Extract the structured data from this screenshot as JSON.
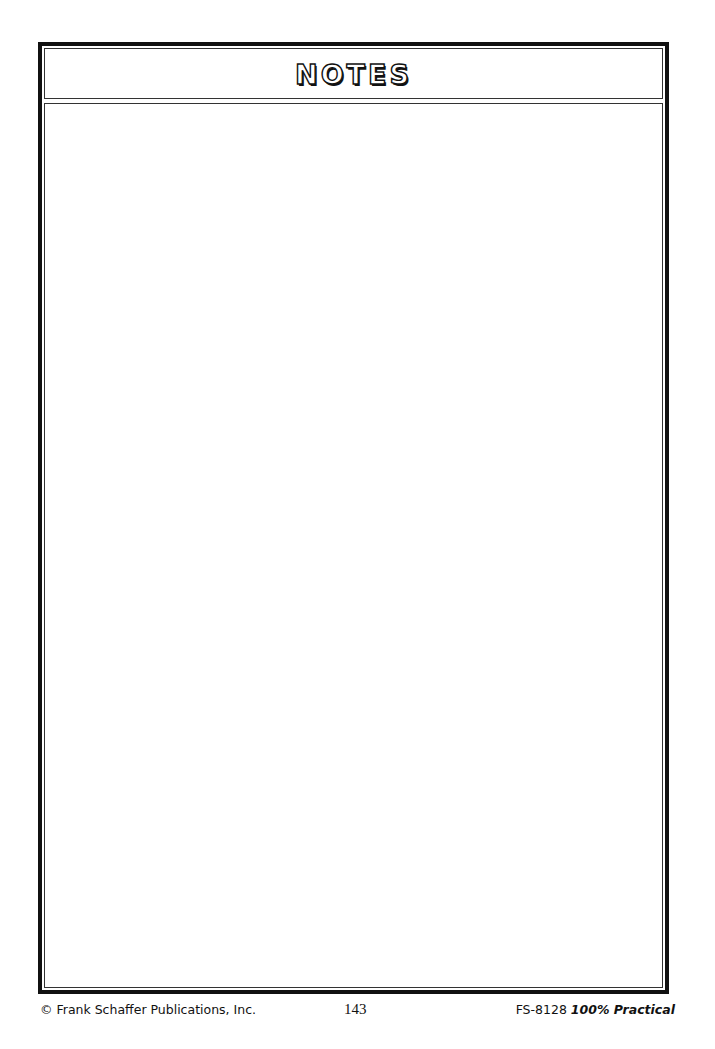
{
  "page": {
    "header": {
      "title": "NOTES"
    },
    "body": {
      "content": ""
    },
    "footer": {
      "copyright": "© Frank Schaffer Publications, Inc.",
      "page_number": "143",
      "book_code": "FS-8128",
      "book_title": "100% Practical"
    }
  }
}
